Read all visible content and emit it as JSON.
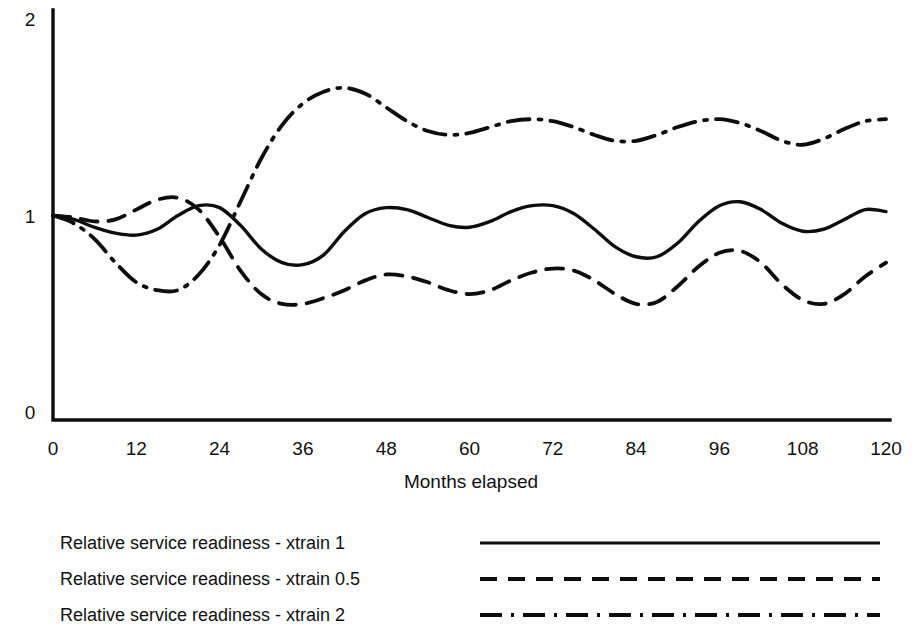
{
  "chart_data": {
    "type": "line",
    "title": "",
    "subtitle": "",
    "xlabel": "Months elapsed",
    "ylabel": "",
    "xlim": [
      0,
      120
    ],
    "ylim": [
      0,
      2
    ],
    "grid": false,
    "legend_position": "below",
    "x_ticks": [
      "0",
      "12",
      "24",
      "36",
      "48",
      "60",
      "72",
      "84",
      "96",
      "108",
      "120"
    ],
    "x_tick_values": [
      0,
      12,
      24,
      36,
      48,
      60,
      72,
      84,
      96,
      108,
      120
    ],
    "y_ticks": [
      "0",
      "1",
      "2"
    ],
    "y_tick_values": [
      0,
      1,
      2
    ],
    "x": [
      0,
      3,
      6,
      9,
      12,
      15,
      18,
      21,
      24,
      27,
      30,
      33,
      36,
      39,
      42,
      45,
      48,
      51,
      54,
      57,
      60,
      63,
      66,
      69,
      72,
      75,
      78,
      81,
      84,
      87,
      90,
      93,
      96,
      99,
      102,
      105,
      108,
      111,
      114,
      117,
      120
    ],
    "series": [
      {
        "name": "Relative service readiness - xtrain 1",
        "line_style": "solid",
        "color": "#0d0d0d",
        "values": [
          1.0,
          0.98,
          0.94,
          0.91,
          0.9,
          0.93,
          1.0,
          1.05,
          1.04,
          0.95,
          0.83,
          0.76,
          0.75,
          0.8,
          0.92,
          1.01,
          1.04,
          1.03,
          0.99,
          0.95,
          0.94,
          0.97,
          1.02,
          1.05,
          1.05,
          1.01,
          0.93,
          0.84,
          0.79,
          0.79,
          0.86,
          0.97,
          1.05,
          1.07,
          1.03,
          0.96,
          0.92,
          0.93,
          0.98,
          1.03,
          1.02
        ]
      },
      {
        "name": "Relative service readiness - xtrain 0.5",
        "line_style": "dashed",
        "color": "#0d0d0d",
        "values": [
          1.0,
          0.99,
          0.97,
          0.98,
          1.03,
          1.08,
          1.09,
          1.03,
          0.89,
          0.72,
          0.6,
          0.55,
          0.55,
          0.58,
          0.62,
          0.67,
          0.7,
          0.69,
          0.66,
          0.62,
          0.6,
          0.62,
          0.67,
          0.71,
          0.73,
          0.72,
          0.67,
          0.6,
          0.55,
          0.56,
          0.64,
          0.74,
          0.81,
          0.82,
          0.76,
          0.65,
          0.57,
          0.55,
          0.6,
          0.69,
          0.76
        ]
      },
      {
        "name": "Relative service readiness - xtrain 2",
        "line_style": "dashdot",
        "color": "#0d0d0d",
        "values": [
          1.0,
          0.96,
          0.88,
          0.76,
          0.66,
          0.62,
          0.62,
          0.7,
          0.85,
          1.07,
          1.29,
          1.46,
          1.57,
          1.63,
          1.65,
          1.62,
          1.55,
          1.48,
          1.43,
          1.41,
          1.42,
          1.45,
          1.48,
          1.49,
          1.48,
          1.45,
          1.41,
          1.38,
          1.38,
          1.41,
          1.45,
          1.48,
          1.49,
          1.47,
          1.43,
          1.38,
          1.36,
          1.39,
          1.44,
          1.48,
          1.49
        ]
      }
    ],
    "legend": [
      {
        "label": "Relative service readiness - xtrain 1",
        "style": "solid"
      },
      {
        "label": "Relative service readiness - xtrain 0.5",
        "style": "dashed"
      },
      {
        "label": "Relative service readiness - xtrain 2",
        "style": "dashdot"
      }
    ]
  }
}
